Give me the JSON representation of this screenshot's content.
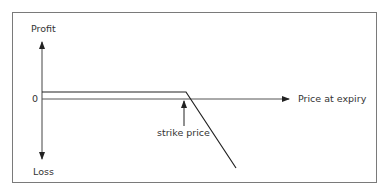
{
  "diagram": {
    "type": "payoff",
    "labels": {
      "y_top": "Profit",
      "y_bottom": "Loss",
      "zero": "0",
      "x_axis": "Price at expiry",
      "annotation": "strike price"
    },
    "colors": {
      "frame": "#7a7a7a",
      "axis": "#555555",
      "payoff": "#222222",
      "text": "#333333"
    }
  }
}
